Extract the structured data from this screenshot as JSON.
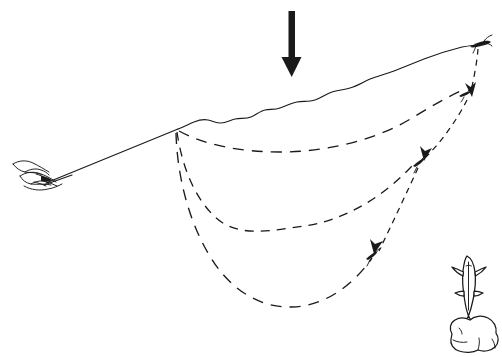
{
  "figure": {
    "kind": "line-art-illustration",
    "caption": "",
    "background_color": "#ffffff",
    "ink_color": "#1a1a1a",
    "width": 502,
    "height": 357
  },
  "elements": {
    "angler_hand": {
      "label": "hand gripping rod butt",
      "x": 10,
      "y": 158,
      "width": 52,
      "height": 32
    },
    "rod": {
      "label": "fly rod",
      "from_x": 18,
      "from_y": 180,
      "to_x": 178,
      "to_y": 129
    },
    "rod_tip": {
      "label": "rod tip / line pivot point",
      "x": 178,
      "y": 129
    },
    "water_surface_line": {
      "label": "fly line on water surface",
      "style": "solid-wavy",
      "from_x": 178,
      "from_y": 129,
      "to_x": 479,
      "to_y": 45
    },
    "down_arrow": {
      "label": "current direction arrow",
      "x": 292,
      "y": 12,
      "length": 60,
      "direction": "down"
    },
    "drift_path_shallow": {
      "label": "shallow drift arc",
      "style": "dashed-long",
      "depth_level": 1
    },
    "drift_path_mid": {
      "label": "mid-depth drift arc",
      "style": "dashed-mid",
      "depth_level": 2
    },
    "drift_path_deep": {
      "label": "deep drift arc",
      "style": "dashed-long",
      "depth_level": 3
    },
    "descent_path": {
      "label": "sinking descent path from surface",
      "style": "dashed-short"
    },
    "fly_surface": {
      "label": "fly at surface entry point",
      "x": 479,
      "y": 45
    },
    "fly_level_1": {
      "label": "fly at first depth",
      "x": 470,
      "y": 95
    },
    "fly_level_2": {
      "label": "fly at second depth",
      "x": 422,
      "y": 162
    },
    "fly_level_3": {
      "label": "fly at third depth",
      "x": 375,
      "y": 258
    },
    "trout": {
      "label": "holding trout",
      "x": 455,
      "y": 258,
      "width": 30,
      "height": 60
    },
    "boulder": {
      "label": "streambed boulder",
      "x": 445,
      "y": 318,
      "width": 55,
      "height": 38
    }
  },
  "legend": {
    "solid_line_meaning": "fly line on the surface",
    "dashed_line_meaning": "sinking leader and fly drift path",
    "arrow_meaning": "direction of drift"
  }
}
